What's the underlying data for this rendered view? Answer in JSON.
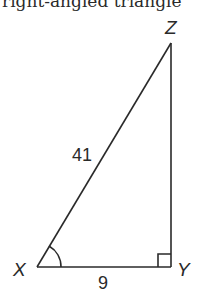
{
  "caption": "right-angled triangle",
  "diagram": {
    "type": "right-triangle",
    "vertices": {
      "X": {
        "label": "X",
        "x": 37,
        "y": 267
      },
      "Y": {
        "label": "Y",
        "x": 171,
        "y": 267
      },
      "Z": {
        "label": "Z",
        "x": 171,
        "y": 43
      }
    },
    "sides": {
      "hypotenuse_XZ": "41",
      "base_XY": "9"
    },
    "right_angle_at": "Y",
    "marked_angle_at": "X",
    "line_color": "#2a2a2a"
  }
}
